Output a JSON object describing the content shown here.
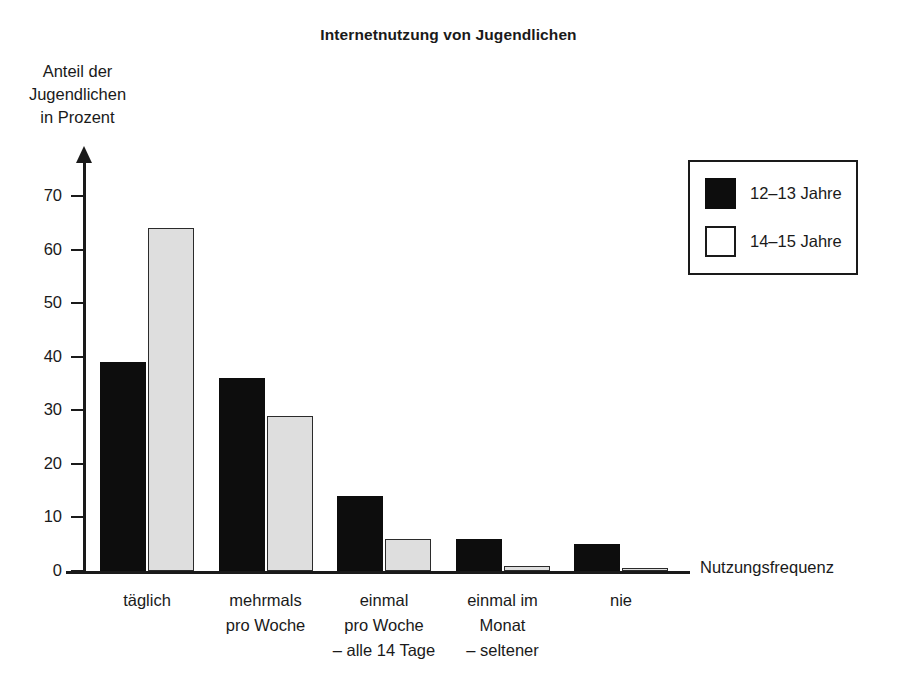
{
  "chart_data": {
    "type": "bar",
    "title": "Internetnutzung von Jugendlichen",
    "subtitle": "",
    "xlabel": "Nutzungsfrequenz",
    "ylabel": "Anteil der\nJugendlichen\nin Prozent",
    "grid": false,
    "legend_position": "top-right",
    "ylim": [
      0,
      75
    ],
    "yticks": [
      0,
      10,
      20,
      30,
      40,
      50,
      60,
      70
    ],
    "ytick_labels": [
      "0",
      "10",
      "20",
      "30",
      "40",
      "50",
      "60",
      "70"
    ],
    "categories": [
      "täglich",
      "mehrmals\npro Woche",
      "einmal\npro Woche\n– alle 14 Tage",
      "einmal im\nMonat\n– seltener",
      "nie"
    ],
    "series": [
      {
        "name": "12–13 Jahre",
        "color": "#0d0d0d",
        "values": [
          39,
          36,
          14,
          6,
          5
        ]
      },
      {
        "name": "14–15 Jahre",
        "color": "#dedede",
        "values": [
          64,
          29,
          6,
          1,
          0.3
        ]
      }
    ]
  },
  "title": "Internetnutzung von Jugendlichen",
  "axes": {
    "y_title": "Anteil der\nJugendlichen\nin Prozent",
    "x_title": "Nutzungsfrequenz"
  },
  "legend": {
    "entries": [
      {
        "label": "12–13 Jahre",
        "style": "dark"
      },
      {
        "label": "14–15 Jahre",
        "style": "light"
      }
    ]
  },
  "colors": {
    "series_1": "#0d0d0d",
    "series_2": "#dedede",
    "axis": "#1a1a1a",
    "background": "#ffffff"
  }
}
